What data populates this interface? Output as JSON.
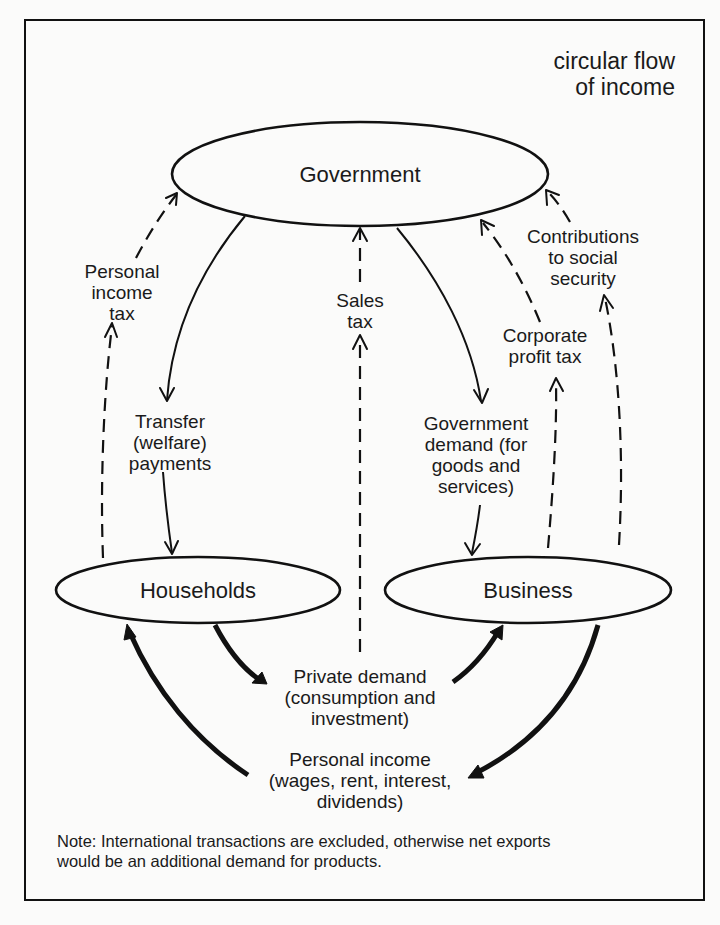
{
  "diagram": {
    "title_lines": [
      "circular flow",
      "of income"
    ],
    "nodes": {
      "government": "Government",
      "households": "Households",
      "business": "Business"
    },
    "flows": {
      "personal_income_tax": [
        "Personal",
        "income",
        "tax"
      ],
      "transfer_payments": [
        "Transfer",
        "(welfare)",
        "payments"
      ],
      "sales_tax": [
        "Sales",
        "tax"
      ],
      "government_demand": [
        "Government",
        "demand (for",
        "goods and",
        "services)"
      ],
      "corporate_profit_tax": [
        "Corporate",
        "profit tax"
      ],
      "contributions_social_security": [
        "Contributions",
        "to social",
        "security"
      ],
      "private_demand": [
        "Private demand",
        "(consumption and",
        "investment)"
      ],
      "personal_income": [
        "Personal income",
        "(wages, rent, interest,",
        "dividends)"
      ]
    },
    "legend": {
      "solid_line": "money flow (solid)",
      "dashed_line": "tax flow (dashed)"
    },
    "note_lines": [
      "Note: International transactions are excluded, otherwise net  exports",
      "would be an additional demand for products."
    ]
  }
}
